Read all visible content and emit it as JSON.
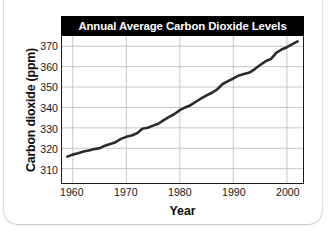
{
  "chart_data": {
    "type": "line",
    "title": "Annual Average Carbon Dioxide Levels",
    "xlabel": "Year",
    "ylabel": "Carbon dioxide (ppm)",
    "xlim": [
      1958,
      2003
    ],
    "ylim": [
      303,
      375
    ],
    "xticks": [
      1960,
      1970,
      1980,
      1990,
      2000
    ],
    "xtick_labels": [
      "1960",
      "1970",
      "1980",
      "1990",
      "2000"
    ],
    "yticks": [
      310,
      320,
      330,
      340,
      350,
      360,
      370
    ],
    "ytick_labels": [
      "310",
      "320",
      "330",
      "340",
      "350",
      "360",
      "370"
    ],
    "grid": true,
    "legend": "none",
    "line_color": "#2b2b2b",
    "title_bar_color": "#000000",
    "title_text_color": "#ffffff",
    "grid_color": "#b8b8b8",
    "axis_color": "#1a1a1a",
    "series": [
      {
        "name": "Annual average CO2",
        "x": [
          1959,
          1960,
          1961,
          1962,
          1963,
          1964,
          1965,
          1966,
          1967,
          1968,
          1969,
          1970,
          1971,
          1972,
          1973,
          1974,
          1975,
          1976,
          1977,
          1978,
          1979,
          1980,
          1981,
          1982,
          1983,
          1984,
          1985,
          1986,
          1987,
          1988,
          1989,
          1990,
          1991,
          1992,
          1993,
          1994,
          1995,
          1996,
          1997,
          1998,
          1999,
          2000,
          2001,
          2002
        ],
        "values": [
          315.9,
          316.9,
          317.6,
          318.4,
          318.9,
          319.6,
          320.0,
          321.3,
          322.1,
          323.0,
          324.6,
          325.6,
          326.3,
          327.4,
          329.6,
          330.1,
          331.1,
          332.0,
          333.8,
          335.4,
          336.8,
          338.7,
          340.0,
          341.1,
          342.8,
          344.4,
          345.9,
          347.2,
          348.9,
          351.5,
          352.9,
          354.2,
          355.6,
          356.4,
          357.1,
          358.8,
          360.8,
          362.6,
          363.7,
          366.7,
          368.4,
          369.5,
          371.0,
          372.4
        ]
      }
    ]
  },
  "card": {
    "background": "#ffffff"
  }
}
